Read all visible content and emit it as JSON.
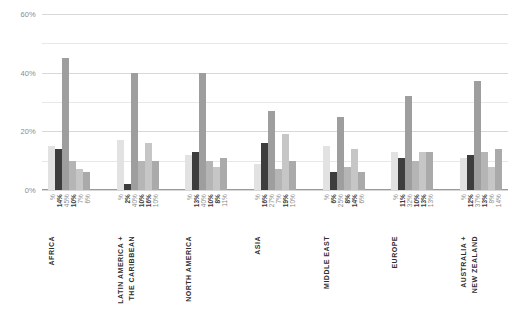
{
  "chart_data": {
    "type": "bar",
    "title": "",
    "subtitle": "",
    "xlabel": "",
    "ylabel": "",
    "ylim": [
      0,
      60
    ],
    "yticks": [
      "0%",
      "20%",
      "40%",
      "60%"
    ],
    "ytick_values": [
      0,
      20,
      40,
      60
    ],
    "minor_gridlines": [
      10,
      30,
      50
    ],
    "grid": true,
    "legend": "none",
    "categories": [
      "AFRICA",
      "LATIN AMERICA + THE CARIBBEAN",
      "NORTH AMERICA",
      "ASIA",
      "MIDDLE EAST",
      "EUROPE",
      "AUSTRALIA + NEW ZEALAND"
    ],
    "category_lines": [
      [
        "AFRICA"
      ],
      [
        "LATIN AMERICA +",
        "THE CARIBBEAN"
      ],
      [
        "NORTH AMERICA"
      ],
      [
        "ASIA"
      ],
      [
        "MIDDLE EAST"
      ],
      [
        "EUROPE"
      ],
      [
        "AUSTRALIA +",
        "NEW ZEALAND"
      ]
    ],
    "series": [
      {
        "name": "bar-1",
        "color": "#e2e2e2",
        "values": [
          15,
          17,
          12,
          9,
          15,
          13,
          11
        ]
      },
      {
        "name": "bar-2",
        "color": "#3d3d3d",
        "values": [
          14,
          2,
          13,
          16,
          6,
          11,
          12
        ]
      },
      {
        "name": "bar-3",
        "color": "#9e9e9e",
        "values": [
          45,
          40,
          40,
          27,
          25,
          32,
          37
        ]
      },
      {
        "name": "bar-4",
        "color": "#b5b5b5",
        "values": [
          10,
          10,
          10,
          7,
          8,
          10,
          13
        ]
      },
      {
        "name": "bar-5",
        "color": "#c6c6c6",
        "values": [
          7,
          16,
          8,
          19,
          14,
          13,
          8
        ]
      },
      {
        "name": "bar-6",
        "color": "#aaaaaa",
        "values": [
          6,
          10,
          11,
          10,
          6,
          13,
          14
        ]
      }
    ],
    "groups": [
      {
        "name": "AFRICA",
        "lines": [
          "AFRICA"
        ],
        "labels": [
          "%",
          "14%",
          "45%",
          "10%",
          "7%",
          "6%"
        ],
        "values": [
          15,
          14,
          45,
          10,
          7,
          6
        ],
        "colors": [
          "#e2e2e2",
          "#3d3d3d",
          "#9e9e9e",
          "#b5b5b5",
          "#c6c6c6",
          "#aaaaaa"
        ],
        "bold": [
          false,
          true,
          false,
          true,
          false,
          false
        ]
      },
      {
        "name": "LATIN AMERICA + THE CARIBBEAN",
        "lines": [
          "LATIN AMERICA +",
          "THE CARIBBEAN"
        ],
        "labels": [
          "%",
          "2%",
          "40%",
          "10%",
          "16%",
          "10%"
        ],
        "values": [
          17,
          2,
          40,
          10,
          16,
          10
        ],
        "colors": [
          "#e2e2e2",
          "#3d3d3d",
          "#9e9e9e",
          "#b5b5b5",
          "#c6c6c6",
          "#aaaaaa"
        ],
        "bold": [
          false,
          true,
          false,
          true,
          true,
          false
        ]
      },
      {
        "name": "NORTH AMERICA",
        "lines": [
          "NORTH AMERICA"
        ],
        "labels": [
          "%",
          "13%",
          "40%",
          "10%",
          "8%",
          "11%"
        ],
        "values": [
          12,
          13,
          40,
          10,
          8,
          11
        ],
        "colors": [
          "#e2e2e2",
          "#3d3d3d",
          "#9e9e9e",
          "#b5b5b5",
          "#c6c6c6",
          "#aaaaaa"
        ],
        "bold": [
          false,
          true,
          false,
          true,
          true,
          false
        ]
      },
      {
        "name": "ASIA",
        "lines": [
          "ASIA"
        ],
        "labels": [
          "%",
          "16%",
          "27%",
          "7%",
          "19%",
          "10%"
        ],
        "values": [
          9,
          16,
          27,
          7,
          19,
          10
        ],
        "colors": [
          "#e2e2e2",
          "#3d3d3d",
          "#9e9e9e",
          "#b5b5b5",
          "#c6c6c6",
          "#aaaaaa"
        ],
        "bold": [
          false,
          true,
          false,
          false,
          true,
          false
        ]
      },
      {
        "name": "MIDDLE EAST",
        "lines": [
          "MIDDLE EAST"
        ],
        "labels": [
          "%",
          "6%",
          "25%",
          "8%",
          "14%",
          "6%"
        ],
        "values": [
          15,
          6,
          25,
          8,
          14,
          6
        ],
        "colors": [
          "#e2e2e2",
          "#3d3d3d",
          "#9e9e9e",
          "#b5b5b5",
          "#c6c6c6",
          "#aaaaaa"
        ],
        "bold": [
          false,
          true,
          false,
          true,
          true,
          false
        ]
      },
      {
        "name": "EUROPE",
        "lines": [
          "EUROPE"
        ],
        "labels": [
          "%",
          "11%",
          "32%",
          "10%",
          "13%",
          "13%"
        ],
        "values": [
          13,
          11,
          32,
          10,
          13,
          13
        ],
        "colors": [
          "#e2e2e2",
          "#3d3d3d",
          "#9e9e9e",
          "#b5b5b5",
          "#c6c6c6",
          "#aaaaaa"
        ],
        "bold": [
          false,
          true,
          false,
          true,
          true,
          false
        ]
      },
      {
        "name": "AUSTRALIA + NEW ZEALAND",
        "lines": [
          "AUSTRALIA +",
          "NEW ZEALAND"
        ],
        "labels": [
          "%",
          "12%",
          "37%",
          "13%",
          "8%",
          "14%"
        ],
        "values": [
          11,
          12,
          37,
          13,
          8,
          14
        ],
        "colors": [
          "#e2e2e2",
          "#3d3d3d",
          "#9e9e9e",
          "#b5b5b5",
          "#c6c6c6",
          "#aaaaaa"
        ],
        "bold": [
          false,
          true,
          false,
          true,
          false,
          false
        ]
      }
    ]
  }
}
